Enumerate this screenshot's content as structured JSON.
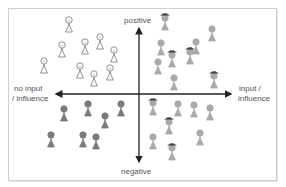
{
  "diagram": {
    "type": "quadrant",
    "axes": {
      "top": "positive",
      "bottom": "negative",
      "left_line1": "no input",
      "left_line2": "/ influence",
      "right_line1": "input /",
      "right_line2": "influence"
    },
    "colors": {
      "axis": "#222222",
      "outline_figure": "#777777",
      "grey_figure": "#a9a9a9",
      "dark_figure": "#7a7a7a",
      "hat": "#333333"
    },
    "quadrants": [
      {
        "name": "top-left",
        "style": "outline",
        "figures": [
          {
            "x": 69,
            "y": 20
          },
          {
            "x": 62,
            "y": 45
          },
          {
            "x": 85,
            "y": 42
          },
          {
            "x": 100,
            "y": 37
          },
          {
            "x": 114,
            "y": 50
          },
          {
            "x": 44,
            "y": 61
          },
          {
            "x": 80,
            "y": 66
          },
          {
            "x": 94,
            "y": 74
          },
          {
            "x": 110,
            "y": 68
          }
        ]
      },
      {
        "name": "top-right",
        "style": "grey",
        "figures": [
          {
            "x": 165,
            "y": 18,
            "hat": true
          },
          {
            "x": 212,
            "y": 29
          },
          {
            "x": 161,
            "y": 43
          },
          {
            "x": 172,
            "y": 55,
            "hat": true
          },
          {
            "x": 190,
            "y": 52,
            "hat": true
          },
          {
            "x": 196,
            "y": 42
          },
          {
            "x": 158,
            "y": 62
          },
          {
            "x": 174,
            "y": 78
          },
          {
            "x": 214,
            "y": 76,
            "hat": true
          }
        ]
      },
      {
        "name": "bottom-left",
        "style": "dark",
        "figures": [
          {
            "x": 64,
            "y": 109
          },
          {
            "x": 88,
            "y": 104
          },
          {
            "x": 105,
            "y": 116
          },
          {
            "x": 121,
            "y": 104
          },
          {
            "x": 51,
            "y": 135
          },
          {
            "x": 83,
            "y": 135
          },
          {
            "x": 96,
            "y": 137
          }
        ]
      },
      {
        "name": "bottom-right",
        "style": "grey",
        "figures": [
          {
            "x": 153,
            "y": 103,
            "hat": true
          },
          {
            "x": 178,
            "y": 104
          },
          {
            "x": 194,
            "y": 105
          },
          {
            "x": 210,
            "y": 108
          },
          {
            "x": 169,
            "y": 122,
            "hat": true
          },
          {
            "x": 200,
            "y": 133
          },
          {
            "x": 153,
            "y": 137
          },
          {
            "x": 172,
            "y": 148,
            "hat": true
          }
        ]
      }
    ]
  }
}
